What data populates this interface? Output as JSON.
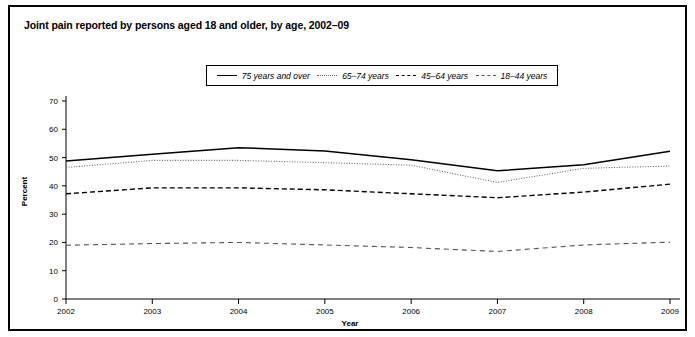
{
  "figure": {
    "title": "Joint pain reported by persons aged 18 and older, by age, 2002–09",
    "border_color": "#000000"
  },
  "legend": {
    "position": "top-center",
    "items": [
      {
        "label": "75 years and over",
        "style": "solid",
        "color": "#000000"
      },
      {
        "label": "65–74 years",
        "style": "dotted",
        "color": "#666666"
      },
      {
        "label": "45–64 years",
        "style": "dashed",
        "color": "#000000"
      },
      {
        "label": "18–44 years",
        "style": "long-dash",
        "color": "#555555"
      }
    ]
  },
  "chart_data": {
    "type": "line",
    "title": "Joint pain reported by persons aged 18 and older, by age, 2002–09",
    "xlabel": "Year",
    "ylabel": "Percent",
    "x": [
      2002,
      2003,
      2004,
      2005,
      2006,
      2007,
      2008,
      2009
    ],
    "categories": [
      "2002",
      "2003",
      "2004",
      "2005",
      "2006",
      "2007",
      "2008",
      "2009"
    ],
    "xlim": [
      2002,
      2009
    ],
    "ylim": [
      0,
      70
    ],
    "yticks": [
      0,
      10,
      20,
      30,
      40,
      50,
      60,
      70
    ],
    "ytick_labels": [
      "0",
      "10",
      "20",
      "30",
      "40",
      "50",
      "60",
      "70"
    ],
    "xticks": [
      2002,
      2003,
      2004,
      2005,
      2006,
      2007,
      2008,
      2009
    ],
    "xtick_labels": [
      "2002",
      "2003",
      "2004",
      "2005",
      "2006",
      "2007",
      "2008",
      "2009"
    ],
    "grid": false,
    "legend_position": "top-center",
    "series": [
      {
        "name": "75 years and over",
        "style": "solid",
        "color": "#000000",
        "values": [
          48.8,
          51.2,
          53.5,
          52.3,
          49.2,
          45.3,
          47.5,
          52.2
        ]
      },
      {
        "name": "65–74 years",
        "style": "dotted",
        "color": "#666666",
        "values": [
          46.5,
          49.0,
          49.0,
          48.2,
          47.3,
          41.2,
          46.2,
          47.0
        ]
      },
      {
        "name": "45–64 years",
        "style": "dashed",
        "color": "#000000",
        "values": [
          37.2,
          39.3,
          39.3,
          38.6,
          37.2,
          35.8,
          37.8,
          40.6
        ]
      },
      {
        "name": "18–44 years",
        "style": "long-dash",
        "color": "#555555",
        "values": [
          19.0,
          19.6,
          20.0,
          19.1,
          18.2,
          16.8,
          19.1,
          20.1
        ]
      }
    ]
  }
}
